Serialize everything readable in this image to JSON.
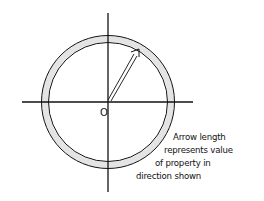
{
  "diagram": {
    "origin_label": "O",
    "caption": [
      "Arrow length",
      "represents value",
      "of property in",
      "direction shown"
    ],
    "colors": {
      "stroke": "#111111",
      "ring_fill": "#e4e4e4",
      "background": "#ffffff"
    },
    "arrow": {
      "direction_deg_from_x_axis": 61,
      "relative_length": "reaches inner edge of ring"
    }
  }
}
